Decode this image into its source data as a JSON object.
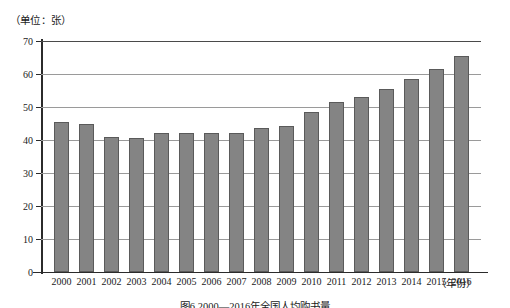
{
  "chart_data": {
    "type": "bar",
    "title": "图6 2000—2016年全国人均购书量",
    "unit_label": "（单位：张）",
    "xlabel": "（年份）",
    "ylabel": "",
    "ylim": [
      0,
      70
    ],
    "yticks": [
      0,
      10,
      20,
      30,
      40,
      50,
      60,
      70
    ],
    "ytick_labels": [
      "0",
      "10",
      "20",
      "30",
      "40",
      "50",
      "60",
      "70"
    ],
    "grid": true,
    "legend": "none",
    "bar_color": "#848484",
    "bar_edge_color": "#5a5a5a",
    "gridline_color": "#9a9a9a",
    "axis_color": "#2b2b2b",
    "categories": [
      "2000",
      "2001",
      "2002",
      "2003",
      "2004",
      "2005",
      "2006",
      "2007",
      "2008",
      "2009",
      "2010",
      "2011",
      "2012",
      "2013",
      "2014",
      "2015",
      "2016"
    ],
    "values": [
      45.5,
      44.8,
      41.0,
      40.7,
      42.2,
      42.2,
      42.2,
      42.2,
      43.5,
      44.3,
      48.6,
      51.5,
      53.0,
      55.5,
      58.6,
      61.4,
      65.6
    ]
  }
}
